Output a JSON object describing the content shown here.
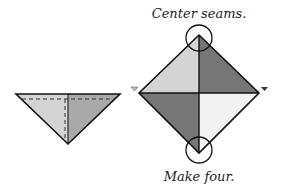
{
  "labels": {
    "top_caption": "Center seams.",
    "bottom_caption": "Make four."
  },
  "colors": {
    "light_gray": "#d4d4d4",
    "mid_gray": "#a9a9a9",
    "dark_gray": "#767676",
    "very_light": "#f2f2f2",
    "stroke": "#111111"
  },
  "figures": {
    "folded_triangle": {
      "description": "Half-square triangle with dashed seam lines"
    },
    "assembled_square": {
      "description": "Four triangles joined into a square on point with center seams circled"
    }
  }
}
